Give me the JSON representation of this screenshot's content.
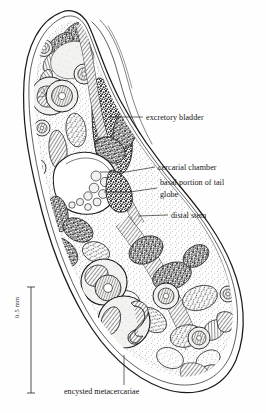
{
  "figure": {
    "kind": "scientific-illustration",
    "style": "pen-and-ink stipple line drawing",
    "background_color": "#fefefe",
    "ink_color": "#151515"
  },
  "labels": [
    {
      "id": "excretory-bladder",
      "text": "excretory bladder",
      "x": 146,
      "y": 113,
      "leader": {
        "x1": 131,
        "y1": 117,
        "x2": 143,
        "y2": 117
      }
    },
    {
      "id": "cercarial-chamber",
      "text": "cercarial chamber",
      "x": 158,
      "y": 163,
      "leader": {
        "x1": 143,
        "y1": 167,
        "x2": 155,
        "y2": 167
      }
    },
    {
      "id": "basal-portion-of-tail",
      "text": "basal portion of tail",
      "x": 160,
      "y": 178,
      "leader": {
        "x1": 145,
        "y1": 188,
        "x2": 157,
        "y2": 188
      }
    },
    {
      "id": "globe",
      "text": "globe",
      "x": 160,
      "y": 190,
      "leader": null
    },
    {
      "id": "distal-stem",
      "text": "distal stem",
      "x": 171,
      "y": 211,
      "leader": {
        "x1": 156,
        "y1": 215,
        "x2": 168,
        "y2": 215
      }
    }
  ],
  "caption": {
    "id": "encysted-metacercariae",
    "text": "encysted metacercariae",
    "leader": {
      "x1": 124,
      "y1": 355,
      "x2": 124,
      "y2": 385
    }
  },
  "scale_bar": {
    "label": "0.5 mm",
    "axis": "vertical",
    "x": 31,
    "y_top": 287,
    "y_bottom": 393,
    "cap_half_width": 4
  }
}
